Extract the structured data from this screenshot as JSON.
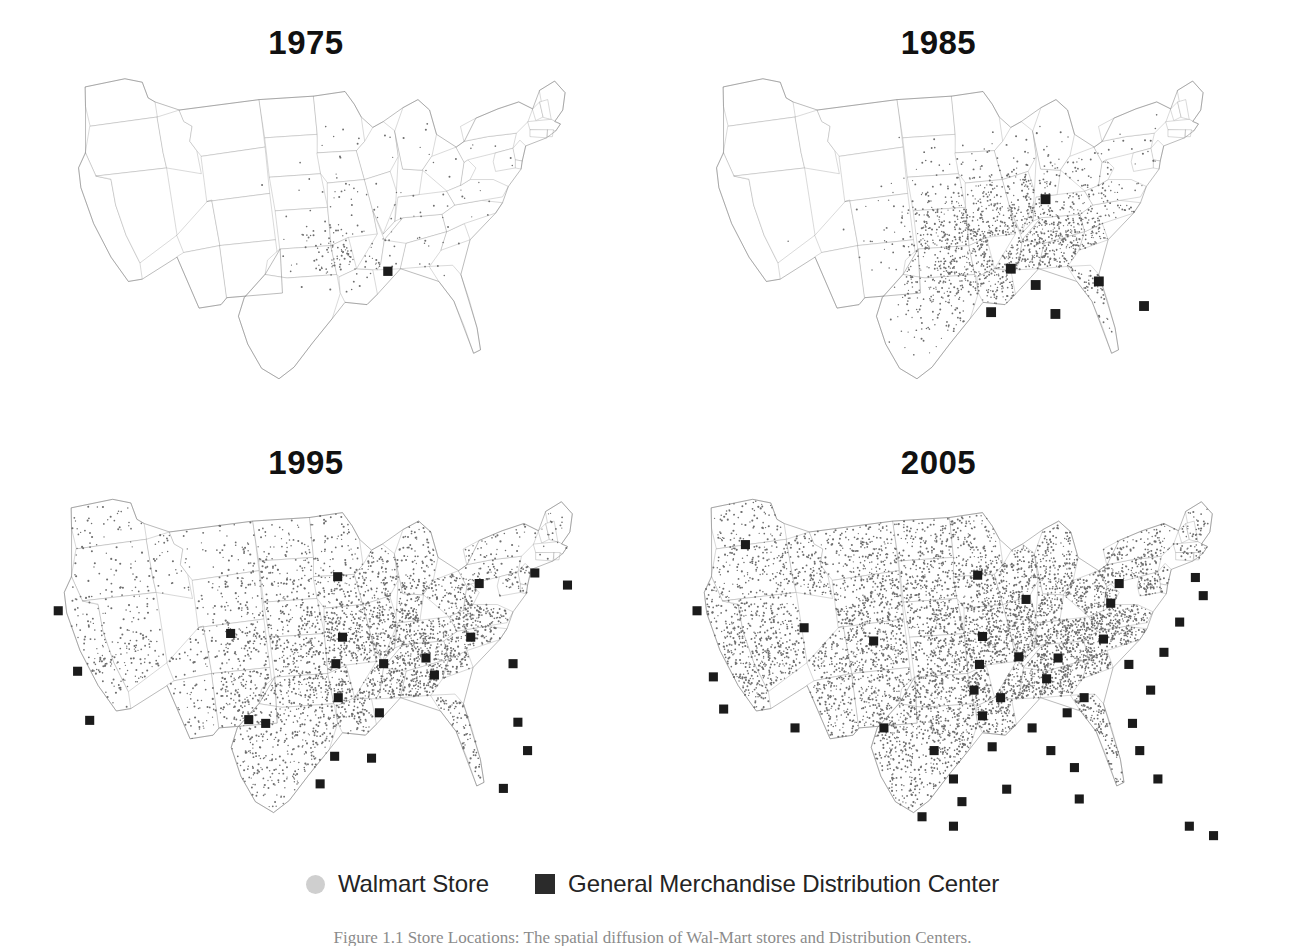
{
  "figure": {
    "kind": "multi-panel-map",
    "background": "#ffffff",
    "panels": [
      {
        "id": "p1975",
        "title": "1975",
        "title_x": 315,
        "title_y": 28,
        "map_x": 55,
        "map_y": 66
      },
      {
        "id": "p1985",
        "title": "1985",
        "title_x": 955,
        "title_y": 28,
        "map_x": 693,
        "map_y": 66
      },
      {
        "id": "p1995",
        "title": "1995",
        "title_x": 315,
        "title_y": 448,
        "map_x": 40,
        "map_y": 486
      },
      {
        "id": "p2005",
        "title": "2005",
        "title_x": 955,
        "title_y": 448,
        "map_x": 680,
        "map_y": 486
      }
    ]
  },
  "legend": {
    "store_label": "Walmart Store",
    "dc_label": "General Merchandise Distribution Center",
    "store_color": "#cfcfcf",
    "dc_color": "#2b2b2b"
  },
  "caption": {
    "text": "Figure 1.1  Store Locations: The spatial diffusion of Wal-Mart stores and Distribution Centers."
  },
  "colors": {
    "state_stroke": "#8a8a8a",
    "outline_stroke": "#6e6e6e",
    "store_dot": "#6d6d6d",
    "dc_marker": "#1b1b1b",
    "title_text": "#111111"
  },
  "chart_data": {
    "type": "map",
    "series": [
      {
        "name": "Walmart Store",
        "marker": "small-gray-dot"
      },
      {
        "name": "General Merchandise Distribution Center",
        "marker": "black-square"
      }
    ],
    "panels": [
      {
        "year": 1975,
        "distribution_centers": 1,
        "store_density": "very-low",
        "region": "Arkansas / Missouri / Oklahoma"
      },
      {
        "year": 1985,
        "distribution_centers": 7,
        "store_density": "low",
        "region": "South Central and Southeast"
      },
      {
        "year": 1995,
        "distribution_centers": 24,
        "store_density": "medium",
        "region": "National, dense east of Rockies"
      },
      {
        "year": 2005,
        "distribution_centers": 42,
        "store_density": "high",
        "region": "National, full coverage"
      }
    ],
    "dc_counts": {
      "1975": 1,
      "1985": 7,
      "1995": 24,
      "2005": 42
    },
    "xlabel": "",
    "ylabel": "",
    "grid": false,
    "legend_position": "bottom-center"
  },
  "dc_positions": {
    "1975": [
      [
        0.574,
        0.567
      ]
    ],
    "1985": [
      [
        0.608,
        0.368
      ],
      [
        0.548,
        0.56
      ],
      [
        0.591,
        0.605
      ],
      [
        0.514,
        0.68
      ],
      [
        0.625,
        0.685
      ],
      [
        0.7,
        0.595
      ],
      [
        0.778,
        0.663
      ]
    ],
    "1995": [
      [
        0.03,
        0.33
      ],
      [
        0.062,
        0.49
      ],
      [
        0.082,
        0.62
      ],
      [
        0.315,
        0.39
      ],
      [
        0.345,
        0.618
      ],
      [
        0.373,
        0.628
      ],
      [
        0.492,
        0.24
      ],
      [
        0.5,
        0.4
      ],
      [
        0.489,
        0.47
      ],
      [
        0.493,
        0.56
      ],
      [
        0.487,
        0.715
      ],
      [
        0.561,
        0.6
      ],
      [
        0.548,
        0.72
      ],
      [
        0.568,
        0.47
      ],
      [
        0.638,
        0.455
      ],
      [
        0.652,
        0.5
      ],
      [
        0.712,
        0.4
      ],
      [
        0.726,
        0.258
      ],
      [
        0.782,
        0.47
      ],
      [
        0.79,
        0.625
      ],
      [
        0.818,
        0.23
      ],
      [
        0.872,
        0.262
      ],
      [
        0.806,
        0.7
      ],
      [
        0.766,
        0.8
      ],
      [
        0.463,
        0.788
      ]
    ],
    "2005": [
      [
        0.108,
        0.155
      ],
      [
        0.028,
        0.33
      ],
      [
        0.055,
        0.505
      ],
      [
        0.072,
        0.59
      ],
      [
        0.19,
        0.64
      ],
      [
        0.205,
        0.375
      ],
      [
        0.32,
        0.41
      ],
      [
        0.337,
        0.64
      ],
      [
        0.42,
        0.7
      ],
      [
        0.452,
        0.775
      ],
      [
        0.466,
        0.835
      ],
      [
        0.4,
        0.875
      ],
      [
        0.452,
        0.9
      ],
      [
        0.492,
        0.236
      ],
      [
        0.5,
        0.398
      ],
      [
        0.495,
        0.472
      ],
      [
        0.486,
        0.54
      ],
      [
        0.5,
        0.608
      ],
      [
        0.516,
        0.69
      ],
      [
        0.53,
        0.56
      ],
      [
        0.56,
        0.452
      ],
      [
        0.572,
        0.3
      ],
      [
        0.582,
        0.64
      ],
      [
        0.606,
        0.51
      ],
      [
        0.613,
        0.7
      ],
      [
        0.625,
        0.455
      ],
      [
        0.64,
        0.6
      ],
      [
        0.652,
        0.745
      ],
      [
        0.66,
        0.828
      ],
      [
        0.668,
        0.56
      ],
      [
        0.7,
        0.405
      ],
      [
        0.712,
        0.31
      ],
      [
        0.726,
        0.258
      ],
      [
        0.742,
        0.472
      ],
      [
        0.748,
        0.628
      ],
      [
        0.76,
        0.7
      ],
      [
        0.778,
        0.54
      ],
      [
        0.79,
        0.775
      ],
      [
        0.8,
        0.44
      ],
      [
        0.826,
        0.36
      ],
      [
        0.852,
        0.242
      ],
      [
        0.865,
        0.29
      ],
      [
        0.842,
        0.9
      ],
      [
        0.882,
        0.925
      ],
      [
        0.54,
        0.802
      ]
    ]
  }
}
